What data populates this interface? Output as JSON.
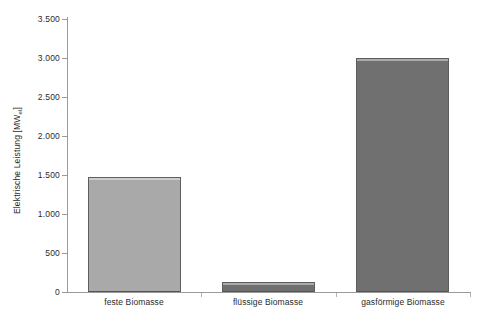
{
  "chart_data": {
    "type": "bar",
    "title": "",
    "subtitle": "",
    "xlabel": "",
    "ylabel": "Elektrische Leistung [MWel]",
    "ylabel_main": "Elektrische Leistung [MW",
    "ylabel_sub": "el",
    "ylabel_tail": "]",
    "categories": [
      "feste Biomasse",
      "flüssige Biomasse",
      "gasförmige Biomasse"
    ],
    "values": [
      1480,
      130,
      3000
    ],
    "ylim": [
      0,
      3500
    ],
    "ytick_values": [
      0,
      500,
      1000,
      1500,
      2000,
      2500,
      3000,
      3500
    ],
    "ytick_labels": [
      "0",
      "500",
      "1.000",
      "1.500",
      "2.000",
      "2.500",
      "3.000",
      "3.500"
    ],
    "grid": false,
    "legend": false,
    "legend_position": "none",
    "bar_colors": [
      "#a9a9a9",
      "#6f6f6f",
      "#707070"
    ],
    "bar_border_color": "#5e5e5e",
    "axis_color": "#9a9a9a",
    "text_color": "#2b2b2b",
    "background_color": "#ffffff",
    "series": [
      {
        "name": "Elektrische Leistung",
        "values": [
          1480,
          130,
          3000
        ]
      }
    ],
    "bars": [
      {
        "category": "feste Biomasse",
        "value": 1480,
        "color": "#a9a9a9"
      },
      {
        "category": "flüssige Biomasse",
        "value": 130,
        "color": "#6f6f6f"
      },
      {
        "category": "gasförmige Biomasse",
        "value": 3000,
        "color": "#707070"
      }
    ]
  }
}
